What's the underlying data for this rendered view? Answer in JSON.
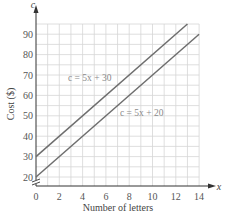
{
  "chart_data": {
    "type": "line",
    "title": "",
    "xlabel": "Number of letters",
    "ylabel": "Cost ($)",
    "x_axis_variable": "x",
    "y_axis_variable": "c",
    "xlim": [
      0,
      14
    ],
    "ylim": [
      20,
      95
    ],
    "x_ticks": [
      0,
      2,
      4,
      6,
      8,
      10,
      12,
      14
    ],
    "y_ticks": [
      20,
      30,
      40,
      50,
      60,
      70,
      80,
      90
    ],
    "x_tick_labels": [
      "0",
      "2",
      "4",
      "6",
      "8",
      "10",
      "12",
      "14"
    ],
    "y_tick_labels": [
      "20",
      "30",
      "40",
      "50",
      "60",
      "70",
      "80",
      "90"
    ],
    "x_origin_label": "0",
    "grid": true,
    "x_minor_step": 1,
    "y_minor_step": 5,
    "y_axis_break": true,
    "series": [
      {
        "name": "c = 5x + 30",
        "label": "c = 5x + 30",
        "slope": 5,
        "intercept": 30,
        "x": [
          0,
          13
        ],
        "values": [
          30,
          95
        ],
        "color": "#6e6e6e"
      },
      {
        "name": "c = 5x + 20",
        "label": "c = 5x + 20",
        "slope": 5,
        "intercept": 20,
        "x": [
          0,
          14
        ],
        "values": [
          20,
          90
        ],
        "color": "#6e6e6e"
      }
    ],
    "colors": {
      "grid": "#d6d6d6",
      "axis": "#333333",
      "line": "#6e6e6e",
      "label": "#8a8a8a"
    }
  }
}
